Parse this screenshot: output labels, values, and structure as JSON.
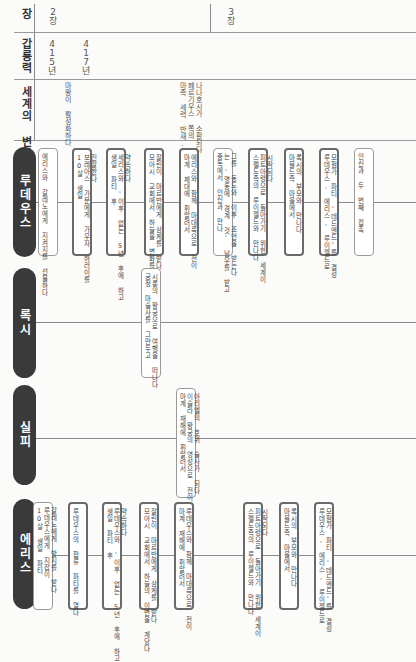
{
  "header": {
    "chapter_label": "장",
    "calendar_label": "갑룡력",
    "world_label": "세계의 변화",
    "chapters": [
      {
        "label": "2장",
        "x": 48
      },
      {
        "label": "3장",
        "x": 226
      }
    ],
    "years": [
      {
        "label": "415년",
        "x": 48
      },
      {
        "label": "417년",
        "x": 82
      }
    ],
    "world_events": [
      {
        "text": "마왕이 활성화하다",
        "x": 63
      },
      {
        "text": "나나호시가 소환되다\n페르기우스 쪽의\n마족 세력 반새.",
        "x": 178
      }
    ]
  },
  "rows": [
    {
      "name": "루데우스",
      "events": [
        {
          "x": 38,
          "bold": false,
          "text": "에리스와 갈레노에게 지켜지를 선물하다"
        },
        {
          "x": 72,
          "bold": true,
          "text": "진잘한다\n보레아스 가문에게 가우자 하러이를\n10살 생일"
        },
        {
          "x": 106,
          "bold": true,
          "text": "약속하다\n세리스와 '이후 없는 5년 후에 하고\n생일 파티 후"
        },
        {
          "x": 144,
          "bold": true,
          "text": "잘린이 마르반에게 삼케를 받다\n모아시 교회에서 하늘을 변화를 계당다"
        },
        {
          "x": 179,
          "bold": true,
          "text": "에리스와 함께 마대륙으로 전이\n마계 제대에 휘말려서"
        },
        {
          "x": 213,
          "bold": false,
          "text": "그를 동도와 이후 조언을 받는다\n는 '명동에 경계 것' 남우를 받고\n중독에서 인신과 만나"
        },
        {
          "x": 248,
          "bold": true,
          "text": "시작되다\n피트아령으로 돌아가기 위한 세계이\n스펠도족의 루이젤드와 만나다"
        },
        {
          "x": 284,
          "bold": true,
          "text": "록시의 부모와 만나다\n마블드족 마을에서"
        },
        {
          "x": 319,
          "bold": true,
          "text": "모험가 파티 '데드엔드'를 결성\n루데우스, 에리스, 루이젤드로"
        },
        {
          "x": 354,
          "bold": false,
          "text": "인신과 두 번째 접촉"
        }
      ]
    },
    {
      "name": "록시",
      "events": [
        {
          "x": 141,
          "bold": false,
          "text": "시롱의 왕궁으로 여행을 떠나다\n궁정 마술사를 그만두고"
        }
      ]
    },
    {
      "name": "실피",
      "events": [
        {
          "x": 176,
          "bold": false,
          "text": "아리엘의 호위 술사가 되다\n이슬라 왕궁의 영성으로 전이\n마계 재해에 휘말려서"
        }
      ]
    },
    {
      "name": "에리스",
      "events": [
        {
          "x": 33,
          "bold": false,
          "text": "갈레노에게 방지를 받다\n루데우스에게 지잡이\n10살 생일 파티"
        },
        {
          "x": 68,
          "bold": true,
          "text": "루데우스의 합류 파티를 열다"
        },
        {
          "x": 102,
          "bold": true,
          "text": "약속하다\n루데우스와 '이후 없는 5년 후에 하고\n생일 파티 후"
        },
        {
          "x": 139,
          "bold": true,
          "text": "잘린이 마르반에게 삼케를 받다\n모아시 교회에서 하늘의 이변을 계당다"
        },
        {
          "x": 174,
          "bold": true,
          "text": "루데우스와 함께 마대륙으로 전이\n마계 재해에 휘말려서"
        },
        {
          "x": 243,
          "bold": true,
          "text": "시작되다\n피트아령으로 돌아가기 위한 세계이\n스펠도족의 루이젤드와 만나다"
        },
        {
          "x": 279,
          "bold": true,
          "text": "록시의 부모와 만나다\n마블드족 마을에서"
        },
        {
          "x": 314,
          "bold": true,
          "text": "모험가 파티 '데드엔드'를 결성\n루데우스, 에리스, 루이젤드로"
        }
      ]
    }
  ]
}
